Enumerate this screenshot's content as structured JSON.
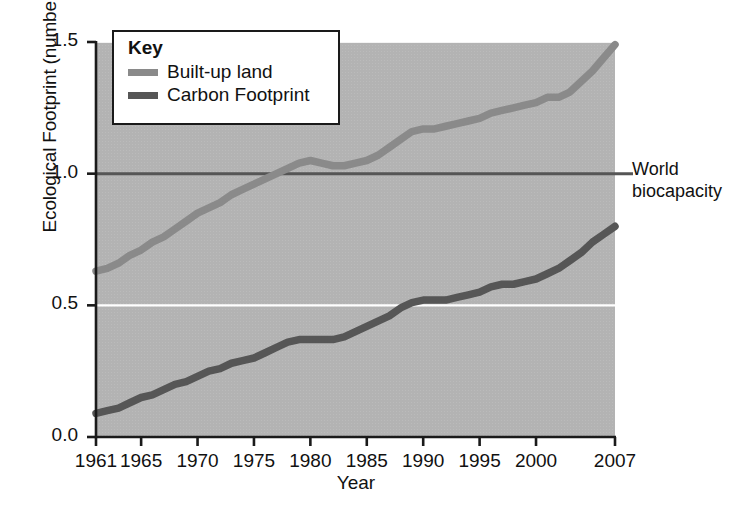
{
  "chart_data": {
    "type": "line",
    "title": "",
    "xlabel": "Year",
    "ylabel": "Ecological Footprint (number of Earths)",
    "xlim": [
      1961,
      2007
    ],
    "ylim": [
      0.0,
      1.5
    ],
    "grid": true,
    "gridlines_y": [
      0.5
    ],
    "y_ticks": [
      "1.5",
      "1.0",
      "0.5",
      "0.0"
    ],
    "y_tick_values": [
      1.5,
      1.0,
      0.5,
      0.0
    ],
    "x_ticks": [
      "1961",
      "1965",
      "1970",
      "1975",
      "1980",
      "1985",
      "1990",
      "1995",
      "2000",
      "2007"
    ],
    "x_tick_values": [
      1961,
      1965,
      1970,
      1975,
      1980,
      1985,
      1990,
      1995,
      2000,
      2007
    ],
    "legend_position": "top-left",
    "legend_title": "Key",
    "series": [
      {
        "name": "Built-up land",
        "color": "#8a8a8a",
        "x": [
          1961,
          1962,
          1963,
          1964,
          1965,
          1966,
          1967,
          1968,
          1969,
          1970,
          1971,
          1972,
          1973,
          1974,
          1975,
          1976,
          1977,
          1978,
          1979,
          1980,
          1981,
          1982,
          1983,
          1984,
          1985,
          1986,
          1987,
          1988,
          1989,
          1990,
          1991,
          1992,
          1993,
          1994,
          1995,
          1996,
          1997,
          1998,
          1999,
          2000,
          2001,
          2002,
          2003,
          2004,
          2005,
          2006,
          2007
        ],
        "values": [
          0.63,
          0.64,
          0.66,
          0.69,
          0.71,
          0.74,
          0.76,
          0.79,
          0.82,
          0.85,
          0.87,
          0.89,
          0.92,
          0.94,
          0.96,
          0.98,
          1.0,
          1.02,
          1.04,
          1.05,
          1.04,
          1.03,
          1.03,
          1.04,
          1.05,
          1.07,
          1.1,
          1.13,
          1.16,
          1.17,
          1.17,
          1.18,
          1.19,
          1.2,
          1.21,
          1.23,
          1.24,
          1.25,
          1.26,
          1.27,
          1.29,
          1.29,
          1.31,
          1.35,
          1.39,
          1.44,
          1.49
        ]
      },
      {
        "name": "Carbon Footprint",
        "color": "#565656",
        "x": [
          1961,
          1962,
          1963,
          1964,
          1965,
          1966,
          1967,
          1968,
          1969,
          1970,
          1971,
          1972,
          1973,
          1974,
          1975,
          1976,
          1977,
          1978,
          1979,
          1980,
          1981,
          1982,
          1983,
          1984,
          1985,
          1986,
          1987,
          1988,
          1989,
          1990,
          1991,
          1992,
          1993,
          1994,
          1995,
          1996,
          1997,
          1998,
          1999,
          2000,
          2001,
          2002,
          2003,
          2004,
          2005,
          2006,
          2007
        ],
        "values": [
          0.09,
          0.1,
          0.11,
          0.13,
          0.15,
          0.16,
          0.18,
          0.2,
          0.21,
          0.23,
          0.25,
          0.26,
          0.28,
          0.29,
          0.3,
          0.32,
          0.34,
          0.36,
          0.37,
          0.37,
          0.37,
          0.37,
          0.38,
          0.4,
          0.42,
          0.44,
          0.46,
          0.49,
          0.51,
          0.52,
          0.52,
          0.52,
          0.53,
          0.54,
          0.55,
          0.57,
          0.58,
          0.58,
          0.59,
          0.6,
          0.62,
          0.64,
          0.67,
          0.7,
          0.74,
          0.77,
          0.8
        ]
      }
    ],
    "reference_lines": [
      {
        "name": "World biocapacity",
        "value": 1.0,
        "orientation": "horizontal",
        "color": "#555555",
        "label": "World\nbiocapacity"
      }
    ],
    "plot_background": "#b3b3b3",
    "gridline_color": "#ffffff"
  },
  "annotations": {
    "biocapacity_label": "World\nbiocapacity"
  },
  "legend": {
    "title": "Key",
    "items": [
      {
        "label": "Built-up land",
        "color": "#8a8a8a"
      },
      {
        "label": "Carbon Footprint",
        "color": "#565656"
      }
    ]
  },
  "axes": {
    "x_title": "Year",
    "y_title": "Ecological Footprint (number of Earths)"
  }
}
